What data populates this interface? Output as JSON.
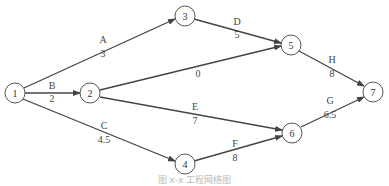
{
  "diagram": {
    "type": "activity-on-arrow network",
    "nodes": [
      {
        "id": "1",
        "label": "1",
        "x": 15,
        "y": 93
      },
      {
        "id": "2",
        "label": "2",
        "x": 90,
        "y": 93
      },
      {
        "id": "3",
        "label": "3",
        "x": 185,
        "y": 16
      },
      {
        "id": "4",
        "label": "4",
        "x": 185,
        "y": 164
      },
      {
        "id": "5",
        "label": "5",
        "x": 291,
        "y": 45
      },
      {
        "id": "6",
        "label": "6",
        "x": 292,
        "y": 133
      },
      {
        "id": "7",
        "label": "7",
        "x": 373,
        "y": 92
      }
    ],
    "edges": [
      {
        "from": "1",
        "to": "3",
        "activity": "A",
        "duration": "3"
      },
      {
        "from": "1",
        "to": "2",
        "activity": "B",
        "duration": "2"
      },
      {
        "from": "1",
        "to": "4",
        "activity": "C",
        "duration": "4.5"
      },
      {
        "from": "3",
        "to": "5",
        "activity": "D",
        "duration": "5"
      },
      {
        "from": "2",
        "to": "5",
        "activity": "",
        "duration": "0"
      },
      {
        "from": "2",
        "to": "6",
        "activity": "E",
        "duration": "7"
      },
      {
        "from": "4",
        "to": "6",
        "activity": "F",
        "duration": "8"
      },
      {
        "from": "5",
        "to": "7",
        "activity": "H",
        "duration": "8"
      },
      {
        "from": "6",
        "to": "7",
        "activity": "G",
        "duration": "6.5"
      }
    ],
    "caption": "图 x-x  工程网络图"
  }
}
